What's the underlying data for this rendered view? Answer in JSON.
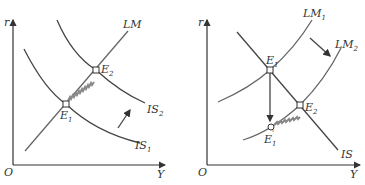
{
  "left_panel": {
    "axes": {
      "y_label": "r",
      "x_label": "Y",
      "origin_label": "O"
    },
    "curves": {
      "lm": {
        "label": "LM",
        "sub": ""
      },
      "is1": {
        "label": "IS",
        "sub": "1"
      },
      "is2": {
        "label": "IS",
        "sub": "2"
      }
    },
    "points": {
      "e1": {
        "label": "E",
        "sub": "1"
      },
      "e2": {
        "label": "E",
        "sub": "2"
      }
    },
    "shift_arrow": "IS shifts right (up-right arrow)",
    "adjustment_path": "E1 to E2 along LM"
  },
  "right_panel": {
    "axes": {
      "y_label": "r",
      "x_label": "Y",
      "origin_label": "O"
    },
    "curves": {
      "is": {
        "label": "IS",
        "sub": ""
      },
      "lm1": {
        "label": "LM",
        "sub": "1"
      },
      "lm2": {
        "label": "LM",
        "sub": "2"
      }
    },
    "points": {
      "e1": {
        "label": "E",
        "sub": "1"
      },
      "e2": {
        "label": "E",
        "sub": "2"
      },
      "e1_prime": {
        "label": "E",
        "sub": "1",
        "prime": "'"
      }
    },
    "shift_arrow": "LM shifts right (down-right arrow)",
    "adjustment_path": "E1 drops to E1' then moves to E2"
  },
  "colors": {
    "line": "#444444",
    "path": "#888888",
    "background": "#ffffff"
  }
}
